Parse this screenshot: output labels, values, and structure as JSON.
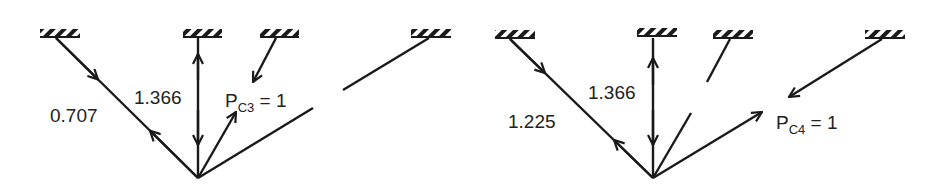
{
  "diagrams": [
    {
      "id": "left",
      "labels": {
        "member1": "0.707",
        "member2": "1.366",
        "load_main": "P",
        "load_sub": "C3",
        "load_eq": " = 1"
      }
    },
    {
      "id": "right",
      "labels": {
        "member1": "1.225",
        "member2": "1.366",
        "load_main": "P",
        "load_sub": "C4",
        "load_eq": " = 1"
      }
    }
  ],
  "colors": {
    "stroke": "#1a1a1a",
    "text": "#222222",
    "background": "#ffffff"
  }
}
